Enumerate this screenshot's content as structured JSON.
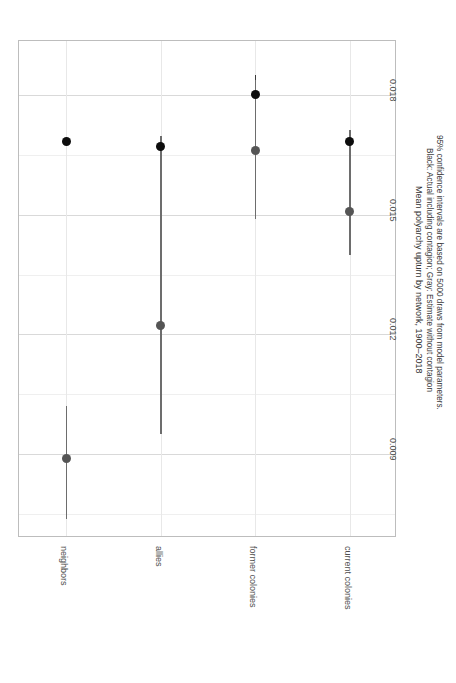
{
  "chart_data": {
    "type": "scatter",
    "title": "Mean polyarchy upturn by network, 1900–2018",
    "caption_lines": [
      "Black: Actual including contagion; Gray: Estimate without contagion",
      "95% confidence intervals are based on 5000 draws from model parameters."
    ],
    "xlabel": "",
    "ylabel": "",
    "orientation": "vertical-rotated",
    "grid": true,
    "legend_position": "none",
    "categories": [
      "neighbors",
      "allies",
      "former colonies",
      "current colonies"
    ],
    "ytick_labels": [
      "0.018",
      "0.015",
      "0.012",
      "0.009"
    ],
    "ytick_values": [
      0.018,
      0.015,
      0.012,
      0.009
    ],
    "ylim": [
      0.0069,
      0.01935
    ],
    "series": [
      {
        "name": "Black: Actual including contagion",
        "color": "#0d0d0d",
        "values": [
          0.01683,
          0.01672,
          0.018,
          0.01683
        ],
        "ci_low": [
          0.01683,
          0.01672,
          0.01756,
          0.01683
        ],
        "ci_high": [
          0.01683,
          0.01672,
          0.01849,
          0.01683
        ]
      },
      {
        "name": "Gray: Estimate without contagion",
        "color": "#555555",
        "values": [
          0.0089,
          0.01222,
          0.01662,
          0.01507
        ],
        "ci_low": [
          0.00737,
          0.0095,
          0.01489,
          0.01398
        ],
        "ci_high": [
          0.0102,
          0.01698,
          0.01838,
          0.01713
        ]
      }
    ]
  }
}
